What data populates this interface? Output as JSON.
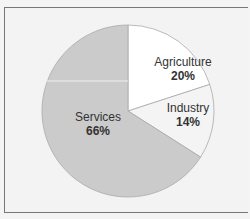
{
  "chart_data": {
    "type": "pie",
    "title": "",
    "categories": [
      "Agriculture",
      "Industry",
      "Services"
    ],
    "values": [
      20,
      14,
      66
    ],
    "labels": [
      "20%",
      "14%",
      "66%"
    ],
    "colors": [
      "#ffffff",
      "#f4f4f4",
      "#cbcbcb"
    ],
    "legend": "none (labels inside slices)",
    "start_angle": "12 o'clock, clockwise"
  },
  "slices": [
    {
      "name": "Agriculture",
      "pct": "20%"
    },
    {
      "name": "Industry",
      "pct": "14%"
    },
    {
      "name": "Services",
      "pct": "66%"
    }
  ]
}
